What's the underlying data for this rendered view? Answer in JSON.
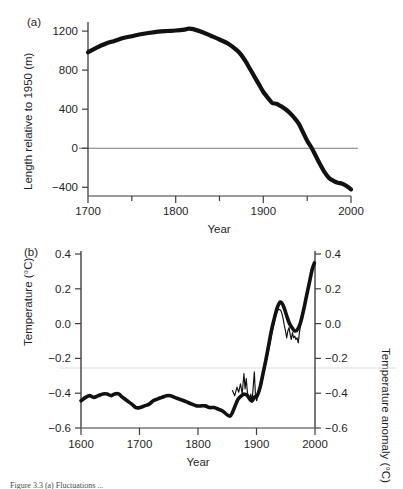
{
  "figure": {
    "panels": [
      {
        "tag": "(a)",
        "ylabel": "Length relative to 1950 (m)",
        "xlabel": "Year"
      },
      {
        "tag": "(b)",
        "ylabel": "Temperature (°C)",
        "ylabel_right": "Temperature anomaly (°C)",
        "xlabel": "Year"
      }
    ],
    "caption": "Figure 3.3 (a) Fluctuations ..."
  },
  "chart_data": [
    {
      "type": "line",
      "panel": "(a)",
      "title": "",
      "xlabel": "Year",
      "ylabel": "Length relative to 1950 (m)",
      "xlim": [
        1700,
        2000
      ],
      "ylim": [
        -480,
        1360
      ],
      "xticks": [
        1700,
        1800,
        1900,
        2000
      ],
      "xticks_minor": [
        1750,
        1850,
        1950
      ],
      "yticks": [
        1200,
        800,
        400,
        0,
        -400
      ],
      "grid": false,
      "reference_lines": [
        {
          "axis": "y",
          "value": 0,
          "color": "#6e6e6e"
        }
      ],
      "legend": "none",
      "series": [
        {
          "name": "Glacier length",
          "style": "thick-solid",
          "color": "#111111",
          "x": [
            1700,
            1710,
            1720,
            1730,
            1740,
            1750,
            1760,
            1770,
            1780,
            1790,
            1800,
            1810,
            1815,
            1820,
            1830,
            1840,
            1850,
            1860,
            1870,
            1875,
            1880,
            1885,
            1890,
            1895,
            1900,
            1905,
            1910,
            1915,
            1920,
            1925,
            1930,
            1935,
            1940,
            1945,
            1950,
            1955,
            1960,
            1965,
            1970,
            1975,
            1980,
            1985,
            1990,
            1995,
            2000
          ],
          "y": [
            1040,
            1090,
            1130,
            1160,
            1190,
            1210,
            1230,
            1245,
            1258,
            1265,
            1270,
            1280,
            1290,
            1285,
            1255,
            1215,
            1175,
            1130,
            1060,
            1010,
            940,
            860,
            780,
            700,
            620,
            560,
            505,
            495,
            470,
            440,
            400,
            350,
            290,
            200,
            105,
            30,
            -60,
            -150,
            -230,
            -290,
            -320,
            -340,
            -350,
            -375,
            -410
          ]
        }
      ]
    },
    {
      "type": "line",
      "panel": "(b)",
      "title": "",
      "xlabel": "Year",
      "ylabel": "Temperature (°C)",
      "ylabel_right": "Temperature anomaly (°C)",
      "xlim": [
        1600,
        2005
      ],
      "ylim": [
        -0.62,
        0.42
      ],
      "xticks": [
        1600,
        1700,
        1800,
        1900,
        2000
      ],
      "yticks": [
        0.4,
        0.2,
        0.0,
        -0.2,
        -0.4,
        -0.6
      ],
      "yticks_labels": [
        "0.4",
        "0.2",
        "0.0",
        "−0.2",
        "−0.4",
        "−0.6"
      ],
      "grid": false,
      "reference_lines": [
        {
          "axis": "y",
          "value": -0.31,
          "color": "#d8d8d8"
        }
      ],
      "legend": "none",
      "series": [
        {
          "name": "Reconstructed temperature (smoothed)",
          "style": "thick-solid",
          "color": "#111111",
          "x": [
            1600,
            1608,
            1615,
            1622,
            1630,
            1638,
            1645,
            1652,
            1658,
            1665,
            1672,
            1680,
            1688,
            1695,
            1702,
            1710,
            1718,
            1725,
            1732,
            1740,
            1748,
            1755,
            1762,
            1770,
            1778,
            1785,
            1792,
            1800,
            1808,
            1815,
            1822,
            1830,
            1838,
            1845,
            1852,
            1858,
            1862,
            1868,
            1872,
            1878,
            1882,
            1888,
            1892,
            1896,
            1900,
            1905,
            1910,
            1915,
            1920,
            1925,
            1930,
            1935,
            1940,
            1945,
            1950,
            1955,
            1960,
            1965,
            1970,
            1975,
            1980,
            1985,
            1990,
            1995,
            2000,
            2004
          ],
          "y": [
            -0.46,
            -0.44,
            -0.43,
            -0.44,
            -0.43,
            -0.42,
            -0.42,
            -0.43,
            -0.42,
            -0.42,
            -0.44,
            -0.46,
            -0.48,
            -0.5,
            -0.5,
            -0.49,
            -0.48,
            -0.46,
            -0.45,
            -0.44,
            -0.43,
            -0.43,
            -0.44,
            -0.45,
            -0.46,
            -0.47,
            -0.48,
            -0.49,
            -0.49,
            -0.49,
            -0.5,
            -0.5,
            -0.51,
            -0.52,
            -0.54,
            -0.55,
            -0.53,
            -0.48,
            -0.45,
            -0.43,
            -0.42,
            -0.43,
            -0.45,
            -0.46,
            -0.44,
            -0.43,
            -0.38,
            -0.3,
            -0.22,
            -0.13,
            -0.04,
            0.03,
            0.09,
            0.12,
            0.1,
            0.05,
            0.0,
            -0.03,
            -0.05,
            -0.04,
            0.0,
            0.07,
            0.15,
            0.23,
            0.31,
            0.35
          ]
        },
        {
          "name": "Instrumental record (annual)",
          "style": "thin-solid",
          "color": "#111111",
          "x": [
            1862,
            1866,
            1870,
            1873,
            1876,
            1879,
            1882,
            1884,
            1886,
            1888,
            1890,
            1892,
            1894,
            1896,
            1898,
            1900,
            1902,
            1904,
            1907,
            1910,
            1914,
            1918,
            1922,
            1926,
            1930,
            1934,
            1938,
            1942,
            1946,
            1948,
            1950,
            1952,
            1954,
            1956,
            1958,
            1960,
            1962,
            1964,
            1966,
            1968,
            1970,
            1972,
            1974,
            1976,
            1978,
            1980,
            1984,
            1988,
            1992,
            1996,
            2000,
            2004
          ],
          "y": [
            -0.4,
            -0.43,
            -0.38,
            -0.41,
            -0.36,
            -0.42,
            -0.3,
            -0.39,
            -0.33,
            -0.41,
            -0.44,
            -0.46,
            -0.42,
            -0.47,
            -0.38,
            -0.29,
            -0.43,
            -0.46,
            -0.42,
            -0.4,
            -0.34,
            -0.27,
            -0.21,
            -0.14,
            -0.07,
            -0.01,
            0.05,
            0.08,
            0.07,
            0.05,
            0.02,
            -0.02,
            -0.05,
            -0.09,
            -0.05,
            -0.03,
            -0.07,
            -0.1,
            -0.06,
            -0.09,
            -0.08,
            -0.1,
            -0.09,
            -0.12,
            -0.06,
            -0.02,
            0.05,
            0.12,
            0.19,
            0.25,
            0.31,
            0.35
          ]
        }
      ]
    }
  ]
}
